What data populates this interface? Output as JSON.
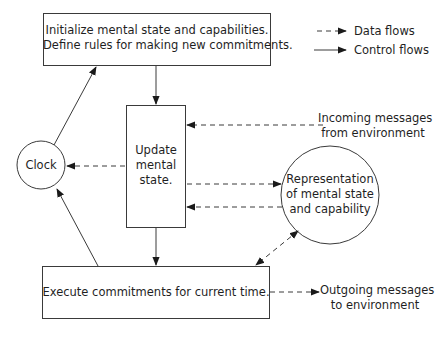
{
  "diagram": {
    "nodes": {
      "init": {
        "line1": "Initialize mental state and capabilities.",
        "line2": "Define rules for making new commitments."
      },
      "update": {
        "line1": "Update",
        "line2": "mental",
        "line3": "state."
      },
      "clock": {
        "label": "Clock"
      },
      "representation": {
        "line1": "Representation",
        "line2": "of mental state",
        "line3": "and capability"
      },
      "execute": {
        "label": "Execute commitments for current time."
      },
      "incoming": {
        "line1": "Incoming messages",
        "line2": "from environment"
      },
      "outgoing": {
        "line1": "Outgoing messages",
        "line2": "to environment"
      }
    },
    "legend": {
      "data_flows": "Data flows",
      "control_flows": "Control flows"
    },
    "edges": [
      {
        "from": "init",
        "to": "update",
        "type": "control"
      },
      {
        "from": "update",
        "to": "execute",
        "type": "control"
      },
      {
        "from": "clock",
        "to": "init",
        "type": "control"
      },
      {
        "from": "execute",
        "to": "clock",
        "type": "control"
      },
      {
        "from": "update",
        "to": "clock",
        "type": "data"
      },
      {
        "from": "incoming",
        "to": "update",
        "type": "data"
      },
      {
        "from": "update",
        "to": "representation",
        "type": "data"
      },
      {
        "from": "representation",
        "to": "update",
        "type": "data"
      },
      {
        "from": "representation",
        "to": "execute",
        "type": "data",
        "bidirectional": true
      },
      {
        "from": "execute",
        "to": "outgoing",
        "type": "data"
      }
    ],
    "colors": {
      "stroke": "#3a3a3a",
      "background": "#ffffff"
    }
  }
}
